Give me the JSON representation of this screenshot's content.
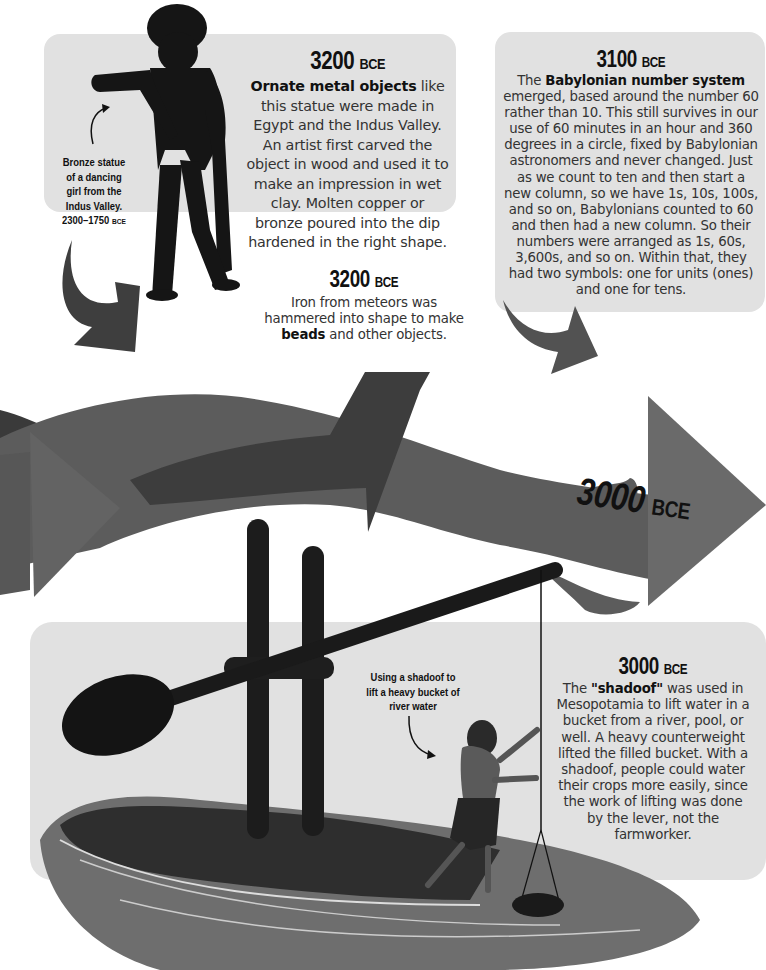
{
  "colors": {
    "panel": "#e1e1e1",
    "arrow_dark": "#3e3e3e",
    "arrow_mid": "#565656",
    "arrow_light": "#6a6a6a",
    "silhouette": "#141414",
    "text": "#333333"
  },
  "entries": [
    {
      "year": "3200",
      "era": "BCE",
      "highlight": "Ornate metal objects",
      "body": " like this statue were made in Egypt and the Indus Valley. An artist first carved the object in wood and used it to make an impression in wet clay. Molten copper or bronze poured into the dip hardened in the right shape."
    },
    {
      "year": "3100",
      "era": "BCE",
      "prefix": "The ",
      "highlight": "Babylonian number system",
      "body": " emerged, based around the number 60 rather than 10. This still survives in our use of 60 minutes in an hour and 360 degrees in a circle, fixed by Babylonian astronomers and never changed. Just as we count to ten and then start a new column, so we have 1s, 10s, 100s, and so on, Babylonians counted to 60 and then had a new column. So their numbers were arranged as 1s, 60s, 3,600s, and so on. Within that, they had two symbols: one for units (ones) and one for tens."
    },
    {
      "year": "3200",
      "era": "BCE",
      "prefix": "Iron from meteors was hammered into shape to make ",
      "highlight": "beads",
      "body": " and other objects."
    },
    {
      "year": "3000",
      "era": "BCE",
      "label": "timeline-marker"
    },
    {
      "year": "3000",
      "era": "BCE",
      "prefix": "The ",
      "highlight": "\"shadoof\"",
      "body": " was used in Mesopotamia to lift water in a bucket from a river, pool, or well. A heavy counterweight lifted the filled bucket. With a shadoof, people could water their crops more easily, since the work of lifting was done by the lever, not the farmworker."
    }
  ],
  "captions": {
    "statue": {
      "lines": [
        "Bronze statue",
        "of a dancing",
        "girl from the",
        "Indus Valley."
      ],
      "dates": "2300–1750",
      "era": "BCE"
    },
    "shadoof": {
      "lines": [
        "Using a shadoof to",
        "lift a heavy bucket of",
        "river water"
      ]
    }
  }
}
